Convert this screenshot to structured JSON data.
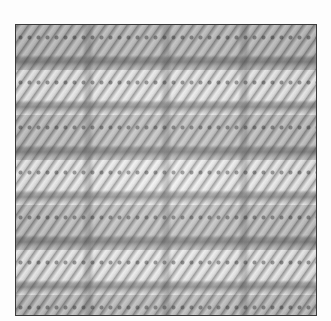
{
  "image": {
    "subject": "needlepoint stitch sample texture",
    "colors": {
      "background": "#fdfdfd",
      "frame_border": "#3a3a3a",
      "stitch_light": "#ececec",
      "stitch_mid": "#b8b8b8",
      "stitch_dark": "#5a5a5a"
    }
  }
}
